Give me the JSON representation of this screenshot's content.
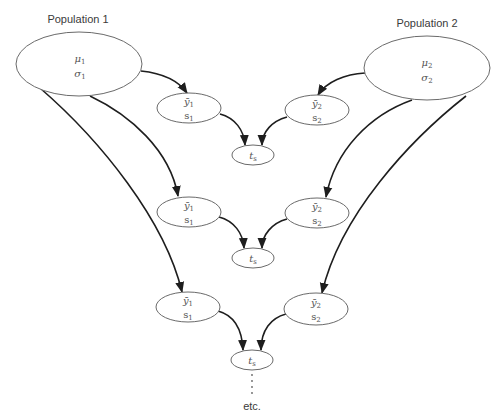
{
  "populations": [
    {
      "label": "Population 1",
      "mean": "μ",
      "mean_sub": "1",
      "sd": "σ",
      "sd_sub": "1"
    },
    {
      "label": "Population 2",
      "mean": "μ",
      "mean_sub": "2",
      "sd": "σ",
      "sd_sub": "2"
    }
  ],
  "samples": {
    "pop1": {
      "mean": "ȳ",
      "mean_sub": "1",
      "sd": "s",
      "sd_sub": "1"
    },
    "pop2": {
      "mean": "ȳ",
      "mean_sub": "2",
      "sd": "s",
      "sd_sub": "2"
    }
  },
  "statistic": {
    "symbol": "t",
    "sub": "s"
  },
  "rows": 3,
  "continuation": {
    "dots": "⋮",
    "label": "etc."
  },
  "colors": {
    "edge": "#1e1e1e",
    "node_stroke": "#6a6a6a",
    "text": "#3a3a3a"
  }
}
